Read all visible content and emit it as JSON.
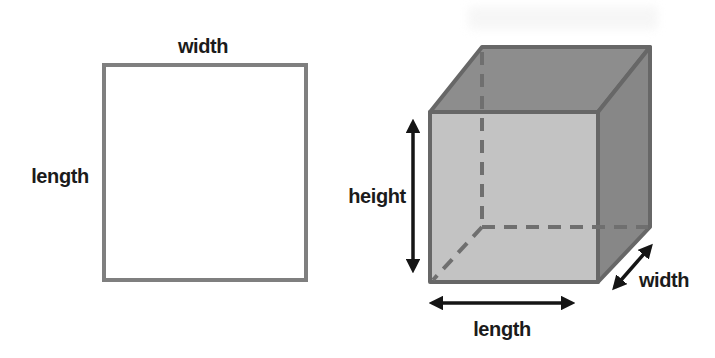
{
  "left_figure": {
    "shape": "square",
    "width_label": "width",
    "length_label": "length"
  },
  "right_figure": {
    "shape": "cube",
    "height_label": "height",
    "length_label": "length",
    "width_label": "width"
  },
  "colors": {
    "background": "#ffffff",
    "square_border": "#7f7f7f",
    "cube_front_face": "#c3c3c3",
    "cube_top_face": "#8d8d8d",
    "cube_right_face": "#878787",
    "cube_edge": "#676767",
    "hidden_edge_dash": "#6f6f6f",
    "arrow": "#151515",
    "text": "#1b1b1b"
  }
}
